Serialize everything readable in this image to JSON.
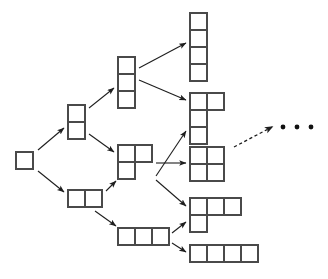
{
  "figure": {
    "background_color": "#ffffff",
    "cell_fill": "#ffffff",
    "cell_stroke": "#4a4a4a",
    "edge_color": "#1e1e1e",
    "cell_size": 17,
    "width": 328,
    "height": 279
  },
  "nodes": [
    {
      "id": "monomino",
      "label": "monomino",
      "size": 1,
      "origin": [
        16,
        152
      ],
      "cells": [
        [
          0,
          0
        ]
      ]
    },
    {
      "id": "domino-vertical",
      "label": "vertical domino",
      "size": 2,
      "origin": [
        68,
        105
      ],
      "cells": [
        [
          0,
          0
        ],
        [
          0,
          1
        ]
      ]
    },
    {
      "id": "domino-horizontal",
      "label": "horizontal domino",
      "size": 2,
      "origin": [
        68,
        190
      ],
      "cells": [
        [
          0,
          0
        ],
        [
          1,
          0
        ]
      ]
    },
    {
      "id": "tromino-vertical",
      "label": "vertical tromino",
      "size": 3,
      "origin": [
        118,
        57
      ],
      "cells": [
        [
          0,
          0
        ],
        [
          0,
          1
        ],
        [
          0,
          2
        ]
      ]
    },
    {
      "id": "tromino-l",
      "label": "L tromino",
      "size": 3,
      "origin": [
        118,
        145
      ],
      "cells": [
        [
          0,
          0
        ],
        [
          1,
          0
        ],
        [
          0,
          1
        ]
      ]
    },
    {
      "id": "tromino-horizontal",
      "label": "horizontal tromino",
      "size": 3,
      "origin": [
        118,
        228
      ],
      "cells": [
        [
          0,
          0
        ],
        [
          1,
          0
        ],
        [
          2,
          0
        ]
      ]
    },
    {
      "id": "tetromino-vertical",
      "label": "vertical tetromino",
      "size": 4,
      "origin": [
        190,
        13
      ],
      "cells": [
        [
          0,
          0
        ],
        [
          0,
          1
        ],
        [
          0,
          2
        ],
        [
          0,
          3
        ]
      ]
    },
    {
      "id": "tetromino-j",
      "label": "J tetromino",
      "size": 4,
      "origin": [
        190,
        93
      ],
      "cells": [
        [
          0,
          0
        ],
        [
          1,
          0
        ],
        [
          0,
          1
        ],
        [
          0,
          2
        ]
      ]
    },
    {
      "id": "tetromino-square",
      "label": "square tetromino",
      "size": 4,
      "origin": [
        190,
        147
      ],
      "cells": [
        [
          0,
          0
        ],
        [
          1,
          0
        ],
        [
          0,
          1
        ],
        [
          1,
          1
        ]
      ]
    },
    {
      "id": "tetromino-l",
      "label": "L tetromino",
      "size": 4,
      "origin": [
        190,
        198
      ],
      "cells": [
        [
          0,
          0
        ],
        [
          1,
          0
        ],
        [
          2,
          0
        ],
        [
          0,
          1
        ]
      ]
    },
    {
      "id": "tetromino-horizontal",
      "label": "horizontal tetromino",
      "size": 4,
      "origin": [
        190,
        245
      ],
      "cells": [
        [
          0,
          0
        ],
        [
          1,
          0
        ],
        [
          2,
          0
        ],
        [
          3,
          0
        ]
      ]
    }
  ],
  "edges": [
    {
      "id": "e1",
      "from": "monomino",
      "to": "domino-vertical",
      "style": "solid",
      "x1": 38,
      "y1": 150,
      "x2": 64,
      "y2": 128
    },
    {
      "id": "e2",
      "from": "monomino",
      "to": "domino-horizontal",
      "style": "solid",
      "x1": 38,
      "y1": 171,
      "x2": 64,
      "y2": 192
    },
    {
      "id": "e3",
      "from": "domino-vertical",
      "to": "tromino-vertical",
      "style": "solid",
      "x1": 89,
      "y1": 108,
      "x2": 114,
      "y2": 88
    },
    {
      "id": "e4",
      "from": "domino-vertical",
      "to": "tromino-l",
      "style": "solid",
      "x1": 89,
      "y1": 134,
      "x2": 114,
      "y2": 152
    },
    {
      "id": "e5",
      "from": "domino-horizontal",
      "to": "tromino-l",
      "style": "solid",
      "x1": 106,
      "y1": 191,
      "x2": 116,
      "y2": 181
    },
    {
      "id": "e6",
      "from": "domino-horizontal",
      "to": "tromino-horizontal",
      "style": "solid",
      "x1": 95,
      "y1": 211,
      "x2": 116,
      "y2": 226
    },
    {
      "id": "e7",
      "from": "tromino-vertical",
      "to": "tetromino-vertical",
      "style": "solid",
      "x1": 139,
      "y1": 68,
      "x2": 186,
      "y2": 43
    },
    {
      "id": "e8",
      "from": "tromino-vertical",
      "to": "tetromino-j",
      "style": "solid",
      "x1": 139,
      "y1": 80,
      "x2": 186,
      "y2": 100
    },
    {
      "id": "e9",
      "from": "tromino-l",
      "to": "tetromino-j",
      "style": "solid",
      "x1": 156,
      "y1": 176,
      "x2": 186,
      "y2": 131
    },
    {
      "id": "e10",
      "from": "tromino-l",
      "to": "tetromino-square",
      "style": "solid",
      "x1": 156,
      "y1": 163,
      "x2": 186,
      "y2": 163
    },
    {
      "id": "e11",
      "from": "tromino-l",
      "to": "tetromino-l",
      "style": "solid",
      "x1": 156,
      "y1": 180,
      "x2": 186,
      "y2": 206
    },
    {
      "id": "e12",
      "from": "tromino-horizontal",
      "to": "tetromino-l",
      "style": "solid",
      "x1": 172,
      "y1": 233,
      "x2": 186,
      "y2": 222
    },
    {
      "id": "e13",
      "from": "tromino-horizontal",
      "to": "tetromino-horizontal",
      "style": "solid",
      "x1": 172,
      "y1": 243,
      "x2": 186,
      "y2": 252
    },
    {
      "id": "e14",
      "from": "tetromino-square",
      "to": "continuation",
      "style": "dashed",
      "x1": 234,
      "y1": 147,
      "x2": 272,
      "y2": 127
    }
  ],
  "ellipsis": {
    "label": "continues",
    "dots": [
      {
        "cx": 283,
        "cy": 127,
        "r": 2.4
      },
      {
        "cx": 297,
        "cy": 127,
        "r": 2.4
      },
      {
        "cx": 311,
        "cy": 127,
        "r": 2.4
      }
    ]
  }
}
